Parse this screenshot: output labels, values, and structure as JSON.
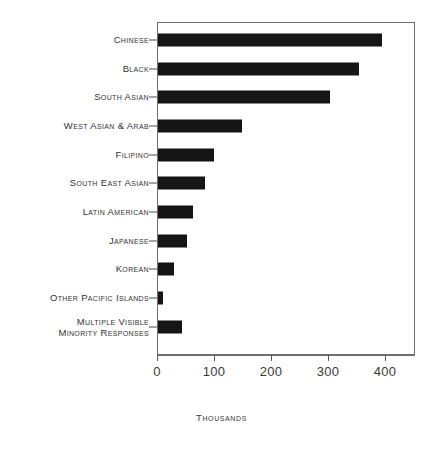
{
  "chart_data": {
    "type": "bar",
    "orientation": "horizontal",
    "title": "",
    "subtitle": "",
    "xlabel": "Thousands",
    "ylabel": "",
    "xlim": [
      0,
      450
    ],
    "xticks": [
      0,
      100,
      200,
      300,
      400
    ],
    "xtick_labels": [
      "0",
      "100",
      "200",
      "300",
      "400"
    ],
    "grid": false,
    "legend": false,
    "legend_position": "none",
    "bar_color": "#151515",
    "frame_color": "#6e6e6e",
    "categories": [
      "Chinese",
      "Black",
      "South Asian",
      "West Asian & Arab",
      "Filipino",
      "South East Asian",
      "Latin American",
      "Japanese",
      "Korean",
      "Other Pacific Islands",
      "Multiple Visible\nMinority Responses"
    ],
    "values": [
      393,
      352,
      302,
      147,
      98,
      83,
      62,
      50,
      28,
      8,
      42
    ]
  },
  "axis": {
    "caption": "Thousands"
  }
}
